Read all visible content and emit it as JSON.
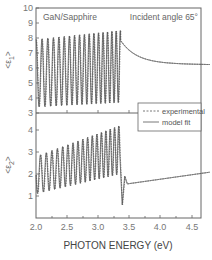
{
  "chart_data": [
    {
      "type": "line",
      "panel": "top",
      "title": "",
      "annotation_left": "GaN/Sapphire",
      "annotation_right": "Incident angle 65°",
      "xlabel": "PHOTON ENERGY (eV)",
      "ylabel": "<ε1>",
      "ylabel_main": "<ε",
      "ylabel_sub": "1",
      "ylabel_end": ">",
      "xlim": [
        2.0,
        4.8
      ],
      "ylim": [
        3,
        10
      ],
      "yticks": [
        "3",
        "4",
        "5",
        "6",
        "7",
        "8",
        "9",
        "10"
      ],
      "grid": false,
      "series": [
        {
          "name": "experimental",
          "style": "dashed",
          "description": "interference oscillations ~ 3.4–8.4 below 3.4 eV, peak ~8.5 near 3.35 eV, then decaying from ~7.5 to ~6.2 at 4.8 eV",
          "x": [
            2.0,
            2.5,
            3.0,
            3.3,
            3.4,
            3.5,
            3.75,
            4.0,
            4.5,
            4.8
          ],
          "y": [
            5.5,
            5.7,
            6.0,
            6.2,
            7.4,
            7.0,
            6.6,
            6.4,
            6.25,
            6.2
          ]
        },
        {
          "name": "model fit",
          "style": "solid",
          "x": [
            2.0,
            2.5,
            3.0,
            3.3,
            3.4,
            3.5,
            3.75,
            4.0,
            4.5,
            4.8
          ],
          "y": [
            5.5,
            5.7,
            6.0,
            6.2,
            7.4,
            7.0,
            6.6,
            6.4,
            6.25,
            6.2
          ]
        }
      ]
    },
    {
      "type": "line",
      "panel": "bottom",
      "title": "",
      "xlabel": "PHOTON ENERGY (eV)",
      "ylabel": "<ε2>",
      "ylabel_main": "<ε",
      "ylabel_sub": "2",
      "ylabel_end": ">",
      "xlim": [
        2.0,
        4.8
      ],
      "ylim": [
        0,
        4.7
      ],
      "yticks": [
        "1",
        "2",
        "3",
        "4"
      ],
      "xticks": [
        "2.0",
        "2.5",
        "3.0",
        "3.5",
        "4.0",
        "4.5"
      ],
      "grid": false,
      "series": [
        {
          "name": "experimental",
          "style": "dashed",
          "description": "interference oscillations with rising envelope (min ~1.0–1.8, max ~2.8–4.3) below 3.35 eV, sharp dip to ~0.6 near 3.38 eV, then slowly rising from ~1.6 to ~2.1",
          "x": [
            2.0,
            2.5,
            3.0,
            3.3,
            3.38,
            3.45,
            3.5,
            4.0,
            4.5,
            4.8
          ],
          "y": [
            1.9,
            2.1,
            2.6,
            3.0,
            0.6,
            1.5,
            1.6,
            1.8,
            1.95,
            2.1
          ]
        },
        {
          "name": "model fit",
          "style": "solid",
          "x": [
            2.0,
            2.5,
            3.0,
            3.3,
            3.38,
            3.45,
            3.5,
            4.0,
            4.5,
            4.8
          ],
          "y": [
            1.9,
            2.1,
            2.6,
            3.0,
            0.6,
            1.5,
            1.6,
            1.8,
            1.95,
            2.1
          ]
        }
      ]
    }
  ],
  "legend": {
    "items": [
      {
        "label": "experimental",
        "style": "dashed"
      },
      {
        "label": "model fit",
        "style": "solid"
      }
    ]
  },
  "labels": {
    "annotation_left": "GaN/Sapphire",
    "annotation_right": "Incident angle 65°",
    "xlabel": "PHOTON ENERGY (eV)",
    "legend_experimental": "experimental",
    "legend_model": "model fit",
    "y1_main": "<ε",
    "y1_sub": "1",
    "y1_end": ">",
    "y2_main": "<ε",
    "y2_sub": "2",
    "y2_end": ">",
    "top_yticks": [
      "3",
      "4",
      "5",
      "6",
      "7",
      "8",
      "9",
      "10"
    ],
    "bottom_yticks": [
      "1",
      "2",
      "3",
      "4"
    ],
    "xticks": [
      "2.0",
      "2.5",
      "3.0",
      "3.5",
      "4.0",
      "4.5"
    ]
  },
  "colors": {
    "line": "#555555",
    "axis": "#666666",
    "text": "#666666"
  }
}
